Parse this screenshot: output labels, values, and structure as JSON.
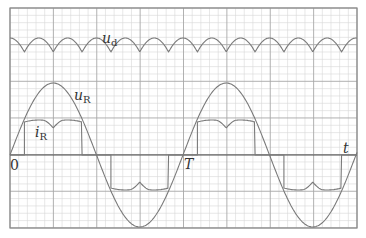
{
  "figure": {
    "title": "",
    "colors": {
      "background": "#ffffff",
      "grid_minor": "#d6d6d6",
      "grid_major": "#a8a8a8",
      "frame": "#8a8a8a",
      "axis": "#555555",
      "waveform": "#7a7a7a",
      "text": "#333333"
    },
    "labels": {
      "ud_main": "u",
      "ud_sub": "d",
      "ur_main": "u",
      "ur_sub": "R",
      "ir_main": "i",
      "ir_sub": "R",
      "origin": "0",
      "period": "T",
      "time_axis": "t"
    }
  },
  "chart_data": {
    "type": "line",
    "title": "",
    "xlabel": "t",
    "ylabel": "",
    "x_ticks": [
      {
        "label": "0",
        "t": 0
      },
      {
        "label": "T",
        "t": 1
      }
    ],
    "xlim": [
      0,
      2
    ],
    "grid": true,
    "series": [
      {
        "name": "u_d",
        "description": "Full-wave rectified ripple voltage, offset above the axis; cusps every T/2... drawn at 6 cusps per period",
        "shape": "rectified-arcs",
        "cusps_per_period": 6,
        "relative_level": "high, small ripple"
      },
      {
        "name": "u_R",
        "description": "Sinusoidal voltage starting at 0, positive peak at T/4, zero at T/2, negative peak at 3T/4, zero at T",
        "shape": "sine",
        "period": 1,
        "amplitude": 1.0
      },
      {
        "name": "i_R",
        "description": "Quasi-square current: positive pulse from ~T/12 to ~5T/12 with a central dip; negative pulse from ~7T/12 to ~11T/12 with a central bump; zero otherwise",
        "shape": "pulsed-square",
        "period": 1,
        "amplitude": 0.45,
        "pulse_windows": [
          [
            0.083,
            0.417
          ],
          [
            0.583,
            0.917
          ]
        ]
      }
    ]
  }
}
